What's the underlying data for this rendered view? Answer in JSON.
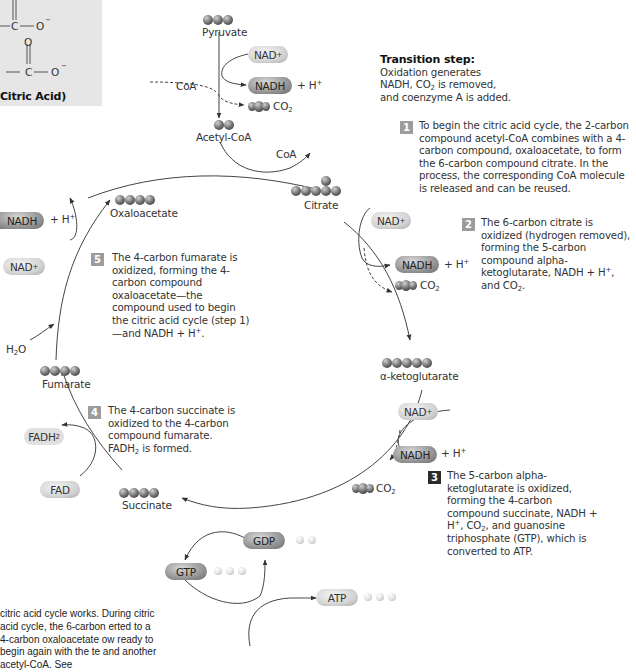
{
  "citric_acid_box": {
    "title": "Citric Acid)",
    "atoms": [
      "C",
      "O",
      "O",
      "C",
      "O"
    ],
    "charge": "−"
  },
  "molecules": {
    "pyruvate": "Pyruvate",
    "acetyl_coa": "Acetyl-CoA",
    "citrate": "Citrate",
    "alpha_ketoglutarate": "α-ketoglutarate",
    "succinate": "Succinate",
    "fumarate": "Fumarate",
    "oxaloacetate": "Oxaloacetate"
  },
  "cofactors": {
    "nad": "NAD",
    "nadh": "NADH",
    "plus_h": "+ H",
    "co2": "CO",
    "coa": "CoA",
    "h2o": "H",
    "fad": "FAD",
    "fadh2": "FADH",
    "gdp": "GDP",
    "gtp": "GTP",
    "atp": "ATP"
  },
  "transition": {
    "heading": "Transition step:",
    "line1": "Oxidation generates",
    "line2a": "NADH, CO",
    "line2b": " is removed,",
    "line3": "and coenzyme A is added."
  },
  "steps": [
    {
      "num": "1",
      "text": "To begin the citric acid cycle, the 2-carbon compound acetyl-CoA combines with a 4-carbon compound, oxaloacetate, to form the 6-carbon compound citrate. In the process, the corresponding CoA molecule is released and can be reused."
    },
    {
      "num": "2",
      "text_a": "The 6-carbon citrate is oxidized (hydrogen removed), forming the 5-carbon compound alpha-ketoglutarate, NADH + H",
      "text_b": ", and CO",
      "text_c": "."
    },
    {
      "num": "3",
      "text_a": "The 5-carbon alpha-ketoglutarate is oxidized, forming the 4-carbon compound succinate, NADH + H",
      "text_b": ", CO",
      "text_c": ", and guanosine triphosphate (GTP), which is converted to ATP."
    },
    {
      "num": "4",
      "text_a": "The 4-carbon succinate is oxidized to the 4-carbon compound fumarate. FADH",
      "text_b": " is formed."
    },
    {
      "num": "5",
      "text_a": "The 4-carbon fumarate is oxidized, forming the 4-carbon compound oxaloacetate—the compound used to begin the citric acid cycle (step 1)—and NADH + H",
      "text_b": "."
    }
  ],
  "caption": {
    "text": "citric acid cycle works. During citric acid cycle, the 6-carbon erted to a 4-carbon oxaloacetate ow ready to begin again with the te and another acetyl-CoA. See"
  },
  "colors": {
    "badge_light": "#9c9c9c",
    "badge_dark": "#2b2b2b",
    "panel_gray": "#e6e6e6",
    "arrow": "#333333"
  }
}
